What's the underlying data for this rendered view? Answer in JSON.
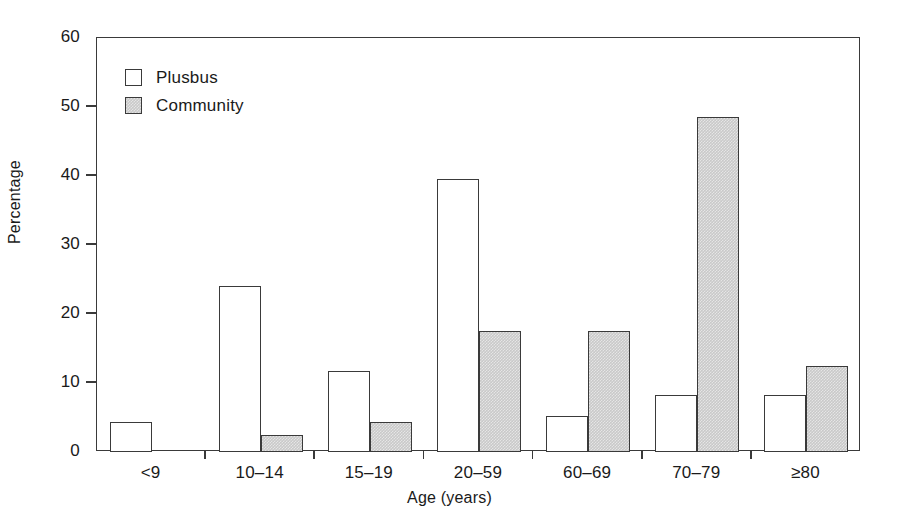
{
  "chart_data": {
    "type": "bar",
    "title": "",
    "xlabel": "Age (years)",
    "ylabel": "Percentage",
    "categories": [
      "<9",
      "10–14",
      "15–19",
      "20–59",
      "60–69",
      "70–79",
      "≥80"
    ],
    "series": [
      {
        "name": "Plusbus",
        "values": [
          4.3,
          24.1,
          11.8,
          39.5,
          5.2,
          8.2,
          8.2
        ],
        "fill": "#ffffff"
      },
      {
        "name": "Community",
        "values": [
          0.0,
          2.5,
          4.3,
          17.5,
          17.5,
          48.5,
          12.5
        ],
        "fill": "#c9c9c9"
      }
    ],
    "ylim": [
      0,
      60
    ],
    "yticks": [
      0,
      10,
      20,
      30,
      40,
      50,
      60
    ],
    "ytick_labels": [
      "0",
      "10",
      "20",
      "30",
      "40",
      "50",
      "60"
    ],
    "grid": false,
    "legend_position": "upper left",
    "legend_entries": [
      "Plusbus",
      "Community"
    ],
    "axis_color": "#3a3a3a"
  }
}
